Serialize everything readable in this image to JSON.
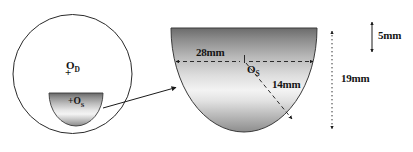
{
  "figure": {
    "type": "technical-diagram",
    "background_color": "#ffffff",
    "line_color": "#1a1a1a"
  },
  "left_view": {
    "name": "detector-cross-section",
    "circle": {
      "name": "detector-outline",
      "center_x": 72,
      "center_y": 74,
      "radius": 60,
      "stroke": "#1a1a1a"
    },
    "detector_center_label": "O",
    "detector_center_subscript": "D",
    "detector_center_marker": "+",
    "source_label_prefix": "+",
    "source_label": "O",
    "source_label_subscript": "S",
    "source_dome": {
      "name": "source-dome-small",
      "left": 49,
      "top": 92,
      "width": 54,
      "height": 34,
      "gradient_top": "#6e6e6e",
      "gradient_mid": "#f2f2f2",
      "gradient_bottom": "#8c8c8c"
    }
  },
  "callout": {
    "name": "magnification-connector",
    "from_x": 104,
    "from_y": 108,
    "to_x": 178,
    "to_y": 88,
    "style": "solid-arrow"
  },
  "right_view": {
    "name": "source-dome-magnified",
    "dome": {
      "left": 168,
      "top": 27,
      "width": 152,
      "height": 106,
      "gradient_top": "#707070",
      "gradient_mid": "#f0f0f0",
      "gradient_bottom": "#909090"
    },
    "center_label": "O",
    "center_subscript": "S",
    "dimensions": [
      {
        "name": "diameter-dimension",
        "label": "28mm",
        "value": 28,
        "unit": "mm",
        "orientation": "horizontal",
        "line_style": "dashed",
        "arrowheads": "both"
      },
      {
        "name": "radius-dimension",
        "label": "14mm",
        "value": 14,
        "unit": "mm",
        "orientation": "diagonal",
        "line_style": "dashed",
        "arrowheads": "end"
      },
      {
        "name": "height-offset-dimension",
        "label": "5mm",
        "value": 5,
        "unit": "mm",
        "orientation": "vertical",
        "line_style": "solid",
        "arrowheads": "both"
      },
      {
        "name": "total-height-dimension",
        "label": "19mm",
        "value": 19,
        "unit": "mm",
        "orientation": "vertical",
        "line_style": "dotted",
        "arrowheads": "both"
      }
    ]
  }
}
